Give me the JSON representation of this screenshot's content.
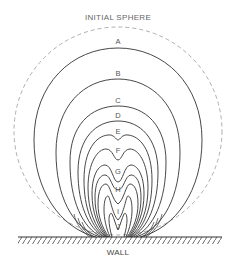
{
  "diagram": {
    "title": "INITIAL SPHERE",
    "wall_label": "WALL",
    "curve_labels": [
      "A",
      "B",
      "C",
      "D",
      "E",
      "F",
      "G",
      "H",
      "I",
      "J"
    ],
    "colors": {
      "line": "#333333",
      "dashed": "#999999",
      "text": "#555555"
    }
  }
}
